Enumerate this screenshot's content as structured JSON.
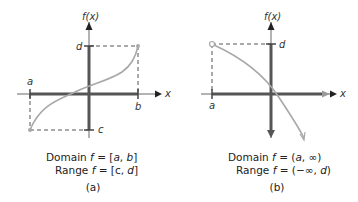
{
  "figure": {
    "colors": {
      "axis_thin": "#9a9a9a",
      "axis_thick": "#555555",
      "curve": "#a8a8a8",
      "dash": "#555555",
      "text": "#222222"
    },
    "panels": [
      {
        "id": "a",
        "y_axis_label": "f(x)",
        "x_axis_label": "x",
        "marks": {
          "a": "a",
          "b": "b",
          "c": "c",
          "d": "d"
        },
        "domain_line": "Domain f = [a, b]",
        "domain_prefix": "Domain ",
        "domain_f": "f",
        "domain_eq": " = [",
        "domain_a": "a",
        "domain_sep": ", ",
        "domain_b": "b",
        "domain_close": "]",
        "range_prefix": "Range ",
        "range_f": "f",
        "range_eq": " = [c, ",
        "range_d": "d",
        "range_close": "]",
        "caption": "(a)",
        "endpoints": {
          "left": "closed",
          "right": "closed"
        }
      },
      {
        "id": "b",
        "y_axis_label": "f(x)",
        "x_axis_label": "x",
        "marks": {
          "a": "a",
          "d": "d"
        },
        "domain_prefix": "Domain ",
        "domain_f": "f",
        "domain_eq": " = (",
        "domain_a": "a",
        "domain_close": ", ∞)",
        "range_prefix": "Range ",
        "range_f": "f",
        "range_eq": " = (−∞, ",
        "range_d": "d",
        "range_close": ")",
        "caption": "(b)",
        "endpoints": {
          "left": "open"
        }
      }
    ]
  }
}
